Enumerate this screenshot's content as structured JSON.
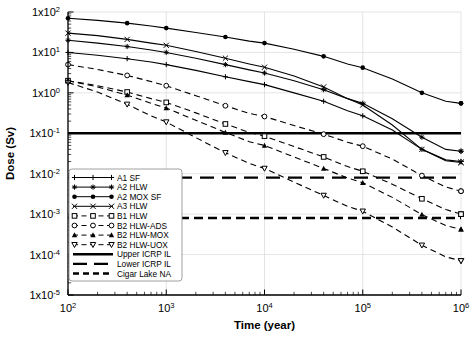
{
  "chart_data": {
    "type": "line",
    "title": "",
    "xlabel": "Time (year)",
    "ylabel": "Dose (Sv)",
    "xscale": "log",
    "yscale": "log",
    "xlim": [
      100,
      1000000
    ],
    "ylim": [
      1e-05,
      100
    ],
    "grid": true,
    "legend_position": "lower-left",
    "xticks": [
      "10^2",
      "10^3",
      "10^4",
      "10^5",
      "10^6"
    ],
    "xtick_values": [
      100,
      1000,
      10000,
      100000,
      1000000
    ],
    "yticks": [
      "1x10^2",
      "1x10^1",
      "1x10^0",
      "1x10^-1",
      "1x10^-2",
      "1x10^-3",
      "1x10^-4",
      "1x10^-5"
    ],
    "ytick_values": [
      100,
      10,
      1,
      0.1,
      0.01,
      0.001,
      0.0001,
      1e-05
    ],
    "x": [
      100,
      200,
      400,
      700,
      1000,
      2000,
      4000,
      7000,
      10000,
      20000,
      40000,
      70000,
      100000,
      200000,
      400000,
      700000,
      1000000
    ],
    "series": [
      {
        "name": "A1 SF",
        "style": "solid",
        "marker": "plus",
        "values": [
          10,
          8.5,
          7.0,
          5.8,
          5.0,
          3.6,
          2.5,
          1.9,
          1.6,
          1.0,
          0.62,
          0.36,
          0.27,
          0.12,
          0.04,
          0.022,
          0.02
        ]
      },
      {
        "name": "A2 HLW",
        "style": "solid",
        "marker": "diamond",
        "values": [
          20,
          17,
          14,
          11.5,
          10,
          7.2,
          5.0,
          3.7,
          3.1,
          2.0,
          1.2,
          0.72,
          0.55,
          0.23,
          0.08,
          0.04,
          0.036
        ]
      },
      {
        "name": "A2 MOX SF",
        "style": "solid",
        "marker": "circle-filled",
        "values": [
          70,
          62,
          53,
          45,
          40,
          31,
          24,
          19,
          17,
          12,
          8.0,
          5.2,
          4.2,
          2.2,
          1.0,
          0.62,
          0.55
        ]
      },
      {
        "name": "A3 HLW",
        "style": "solid",
        "marker": "x",
        "values": [
          30,
          26,
          21,
          17,
          15,
          10.5,
          7.2,
          5.2,
          4.3,
          2.6,
          1.4,
          0.72,
          0.5,
          0.16,
          0.04,
          0.021,
          0.019
        ]
      },
      {
        "name": "B1 HLW",
        "style": "dashed",
        "marker": "square-open",
        "values": [
          2.0,
          1.5,
          1.05,
          0.72,
          0.58,
          0.32,
          0.17,
          0.105,
          0.085,
          0.047,
          0.026,
          0.015,
          0.0115,
          0.0055,
          0.0024,
          0.0013,
          0.001
        ]
      },
      {
        "name": "B2 HLW-ADS",
        "style": "dashed",
        "marker": "circle-open",
        "values": [
          5.0,
          3.8,
          2.7,
          1.9,
          1.5,
          0.85,
          0.48,
          0.31,
          0.26,
          0.155,
          0.095,
          0.06,
          0.048,
          0.023,
          0.009,
          0.0047,
          0.0037
        ]
      },
      {
        "name": "B2 HLW-MOX",
        "style": "dashed",
        "marker": "triangle-filled",
        "values": [
          2.0,
          1.4,
          0.88,
          0.55,
          0.42,
          0.21,
          0.105,
          0.062,
          0.05,
          0.026,
          0.0135,
          0.0078,
          0.006,
          0.0026,
          0.00098,
          0.00052,
          0.00042
        ]
      },
      {
        "name": "B2 HLW-UOX",
        "style": "dashed",
        "marker": "triangle-open",
        "values": [
          1.8,
          1.05,
          0.52,
          0.27,
          0.19,
          0.078,
          0.033,
          0.018,
          0.0135,
          0.0062,
          0.0029,
          0.00155,
          0.00118,
          0.00048,
          0.00017,
          8.8e-05,
          7e-05
        ]
      }
    ],
    "reference_lines": [
      {
        "name": "Upper ICRP IL",
        "value": 0.1,
        "style": "solid-thick"
      },
      {
        "name": "Lower ICRP IL",
        "value": 0.008,
        "style": "dashed-long"
      },
      {
        "name": "Cigar Lake NA",
        "value": 0.0008,
        "style": "dashed-thick"
      }
    ],
    "legend_entries": [
      "A1 SF",
      "A2 HLW",
      "A2 MOX SF",
      "A3 HLW",
      "B1 HLW",
      "B2 HLW-ADS",
      "B2 HLW-MOX",
      "B2 HLW-UOX",
      "Upper ICRP IL",
      "Lower ICRP IL",
      "Cigar Lake NA"
    ],
    "colors": {
      "line": "#000000",
      "grid": "#d9d9d9",
      "axis": "#000000",
      "background": "#ffffff"
    }
  }
}
